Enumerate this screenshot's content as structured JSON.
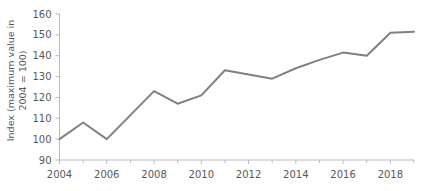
{
  "chart_data": {
    "type": "line",
    "title": "",
    "xlabel": "",
    "ylabel_line1": "Index (maximum value in",
    "ylabel_line2": "2004 = 100)",
    "ylabel": "Index (maximum value in 2004 = 100)",
    "x": [
      2004,
      2005,
      2006,
      2007,
      2008,
      2009,
      2010,
      2011,
      2012,
      2013,
      2014,
      2015,
      2016,
      2017,
      2018,
      2019
    ],
    "values": [
      100,
      108,
      100,
      111.5,
      123,
      117,
      121,
      133,
      131,
      129,
      134,
      138,
      141.5,
      140,
      151,
      151.5
    ],
    "series": [
      {
        "name": "Index",
        "values": [
          100,
          108,
          100,
          111.5,
          123,
          117,
          121,
          133,
          131,
          129,
          134,
          138,
          141.5,
          140,
          151,
          151.5
        ]
      }
    ],
    "xlim": [
      2004,
      2019
    ],
    "ylim": [
      90,
      160
    ],
    "ytick_labels": [
      "160",
      "150",
      "140",
      "130",
      "120",
      "110",
      "100",
      "90"
    ],
    "yticks": [
      160,
      150,
      140,
      130,
      120,
      110,
      100,
      90
    ],
    "xtick_labels": [
      "2004",
      "2006",
      "2008",
      "2010",
      "2012",
      "2014",
      "2016",
      "2018"
    ],
    "xticks": [
      2004,
      2006,
      2008,
      2010,
      2012,
      2014,
      2016,
      2018
    ],
    "xticks_minor": [
      2005,
      2007,
      2009,
      2011,
      2013,
      2015,
      2017,
      2019
    ],
    "grid": false,
    "legend": "none",
    "line_color": "#808084",
    "axis_color": "#b9b9bd",
    "text_color": "#58585a",
    "background": "#ffffff"
  }
}
